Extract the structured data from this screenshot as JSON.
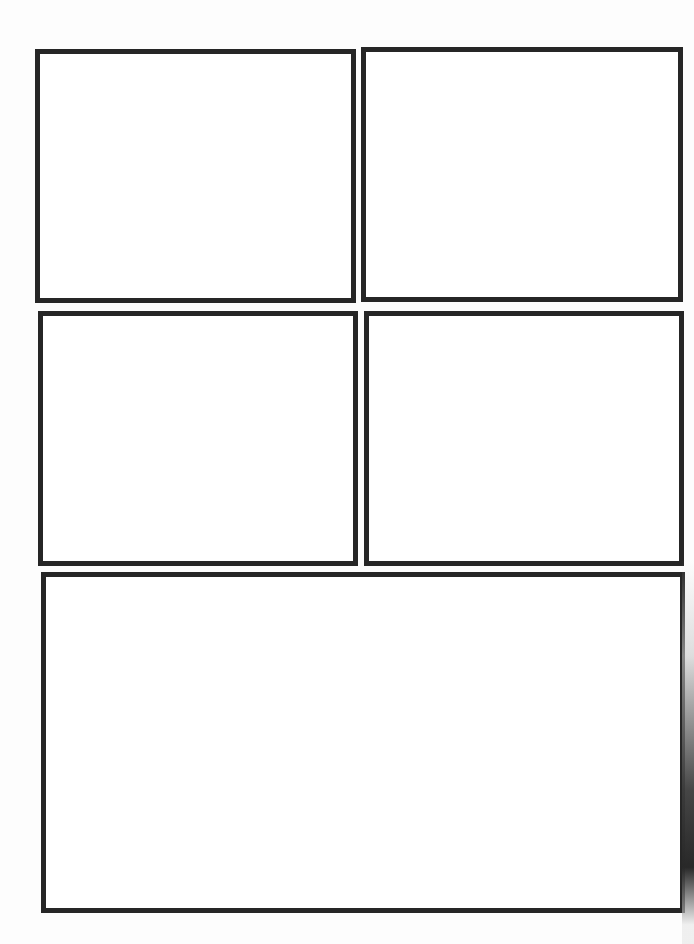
{
  "page": {
    "type": "comic-panel-template",
    "panel_count": 5,
    "border_color": "#262626",
    "background_color": "#ffffff"
  },
  "panels": [
    {
      "id": "panel-1",
      "content": ""
    },
    {
      "id": "panel-2",
      "content": ""
    },
    {
      "id": "panel-3",
      "content": ""
    },
    {
      "id": "panel-4",
      "content": ""
    },
    {
      "id": "panel-5",
      "content": ""
    }
  ]
}
